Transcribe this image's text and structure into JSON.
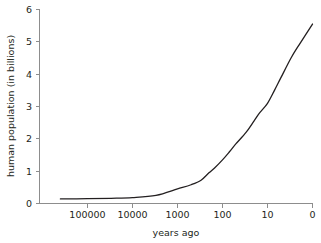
{
  "chart_data": {
    "type": "line",
    "title": "",
    "xlabel": "years ago",
    "ylabel": "human population (in billions)",
    "xscale": "log-reversed",
    "xtick_labels": [
      "100000",
      "10000",
      "1000",
      "100",
      "10",
      "0"
    ],
    "xtick_values": [
      100000,
      10000,
      1000,
      100,
      10,
      0
    ],
    "ytick_labels": [
      "0",
      "1",
      "2",
      "3",
      "4",
      "5",
      "6"
    ],
    "ytick_values": [
      0,
      1,
      2,
      3,
      4,
      5,
      6
    ],
    "ylim": [
      0,
      6
    ],
    "xlim_label_left": "400000",
    "grid": false,
    "legend": false,
    "series": [
      {
        "name": "human population",
        "units": "billions",
        "x": [
          400000,
          100000,
          30000,
          10000,
          3000,
          1000,
          500,
          300,
          200,
          150,
          100,
          70,
          50,
          30,
          20,
          15,
          10,
          7,
          5,
          3,
          2,
          1
        ],
        "values": [
          0.14,
          0.15,
          0.16,
          0.18,
          0.25,
          0.45,
          0.58,
          0.72,
          0.95,
          1.1,
          1.35,
          1.6,
          1.85,
          2.2,
          2.55,
          2.8,
          3.1,
          3.5,
          3.9,
          4.5,
          4.9,
          5.55
        ]
      }
    ],
    "colors": {
      "curve": "#231f20",
      "axis": "#8d8d8d",
      "text": "#231f20",
      "background": "#ffffff"
    }
  },
  "axes": {
    "y_title": "human population (in billions)",
    "x_title": "years ago",
    "y_ticks": [
      {
        "label": "6",
        "value": 6
      },
      {
        "label": "5",
        "value": 5
      },
      {
        "label": "4",
        "value": 4
      },
      {
        "label": "3",
        "value": 3
      },
      {
        "label": "2",
        "value": 2
      },
      {
        "label": "1",
        "value": 1
      },
      {
        "label": "0",
        "value": 0
      }
    ],
    "x_ticks": [
      {
        "label": "100000",
        "value": 100000
      },
      {
        "label": "10000",
        "value": 10000
      },
      {
        "label": "1000",
        "value": 1000
      },
      {
        "label": "100",
        "value": 100
      },
      {
        "label": "10",
        "value": 10
      },
      {
        "label": "0",
        "value": 0
      }
    ]
  }
}
